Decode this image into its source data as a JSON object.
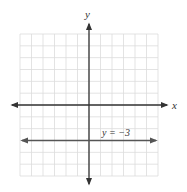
{
  "chart_data": {
    "type": "line",
    "title": "",
    "xlabel": "x",
    "ylabel": "y",
    "xlim": [
      -6,
      6
    ],
    "ylim": [
      -6,
      6
    ],
    "grid": true,
    "grid_step": 1,
    "axes_arrows": true,
    "series": [
      {
        "name": "y = -3",
        "equation": "y = -3",
        "x": [
          -6,
          6
        ],
        "y": [
          -3,
          -3
        ],
        "arrows_both_ends": true,
        "color": "#555555"
      }
    ],
    "annotations": [
      {
        "text": "y = −3",
        "x": 1,
        "y": -2.5
      }
    ]
  },
  "labels": {
    "x_axis": "x",
    "y_axis": "y",
    "line_label": "y = −3"
  },
  "colors": {
    "grid": "#dcdcdc",
    "axis": "#333333",
    "line": "#555555",
    "background": "#ffffff"
  }
}
